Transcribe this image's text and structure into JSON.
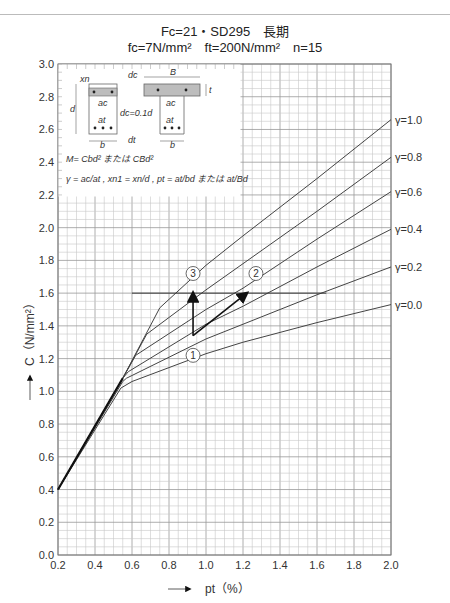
{
  "header": {
    "line1": "Fc=21・SD295　長期",
    "line2": "fc=7N/mm²　ft=200N/mm²　n=15"
  },
  "axes": {
    "ylabel": "C（N/mm²）",
    "xlabel": "pt（%）"
  },
  "inset": {
    "formula_m": "M= Cbd² または CBd²",
    "formula_gamma": "γ = ac/at , xn1 = xn/d , pt = at/bd または at/Bd",
    "dc_label": "dc=0.1d",
    "labels": [
      "B",
      "b",
      "b",
      "d",
      "ac",
      "at",
      "ac",
      "at",
      "dc",
      "dt",
      "t",
      "xn"
    ]
  },
  "annotations": {
    "circles": [
      "①",
      "②",
      "③"
    ],
    "reference_line_C": 1.6
  },
  "chart_data": {
    "type": "line",
    "xlabel": "pt (%)",
    "ylabel": "C (N/mm²)",
    "xlim": [
      0.2,
      2.0
    ],
    "ylim": [
      0.0,
      3.0
    ],
    "xticks": [
      0.2,
      0.4,
      0.6,
      0.8,
      1.0,
      1.2,
      1.4,
      1.6,
      1.8,
      2.0
    ],
    "yticks": [
      0.0,
      0.2,
      0.4,
      0.6,
      0.8,
      1.0,
      1.2,
      1.4,
      1.6,
      1.8,
      2.0,
      2.2,
      2.4,
      2.6,
      2.8,
      3.0
    ],
    "grid": true,
    "minor_grid_step": {
      "x": 0.05,
      "y": 0.05
    },
    "series": [
      {
        "name": "γ=1.0",
        "label": "γ=1.0",
        "x": [
          0.2,
          0.55,
          0.75,
          1.0,
          1.2,
          1.6,
          2.0
        ],
        "y": [
          0.4,
          1.08,
          1.51,
          1.77,
          1.95,
          2.3,
          2.66
        ]
      },
      {
        "name": "γ=0.8",
        "label": "γ=0.8",
        "x": [
          0.2,
          0.55,
          0.68,
          1.0,
          1.2,
          1.6,
          2.0
        ],
        "y": [
          0.4,
          1.08,
          1.35,
          1.62,
          1.78,
          2.1,
          2.43
        ]
      },
      {
        "name": "γ=0.6",
        "label": "γ=0.6",
        "x": [
          0.2,
          0.55,
          0.62,
          1.0,
          1.2,
          1.6,
          2.0
        ],
        "y": [
          0.4,
          1.08,
          1.22,
          1.5,
          1.63,
          1.93,
          2.22
        ]
      },
      {
        "name": "γ=0.4",
        "label": "γ=0.4",
        "x": [
          0.2,
          0.55,
          0.58,
          1.0,
          1.2,
          1.6,
          2.0
        ],
        "y": [
          0.4,
          1.08,
          1.12,
          1.41,
          1.52,
          1.76,
          1.99
        ]
      },
      {
        "name": "γ=0.2",
        "label": "γ=0.2",
        "x": [
          0.2,
          0.55,
          0.57,
          1.0,
          1.2,
          1.6,
          2.0
        ],
        "y": [
          0.4,
          1.06,
          1.08,
          1.32,
          1.41,
          1.59,
          1.76
        ]
      },
      {
        "name": "γ=0.0",
        "label": "γ=0.0",
        "x": [
          0.2,
          0.54,
          0.6,
          1.0,
          1.2,
          1.6,
          2.0
        ],
        "y": [
          0.4,
          1.02,
          1.06,
          1.23,
          1.3,
          1.42,
          1.53
        ]
      }
    ],
    "annotations": [
      {
        "label": "①",
        "x": 0.93,
        "y": 1.22
      },
      {
        "label": "②",
        "x": 1.27,
        "y": 1.72
      },
      {
        "label": "③",
        "x": 0.93,
        "y": 1.72
      },
      {
        "type": "hline",
        "y": 1.6,
        "x_from": 0.6,
        "x_to": 1.65
      },
      {
        "type": "arrow",
        "from": [
          0.93,
          1.34
        ],
        "to": [
          0.93,
          1.6
        ]
      },
      {
        "type": "arrow",
        "from": [
          0.93,
          1.34
        ],
        "to": [
          1.22,
          1.6
        ]
      }
    ]
  }
}
